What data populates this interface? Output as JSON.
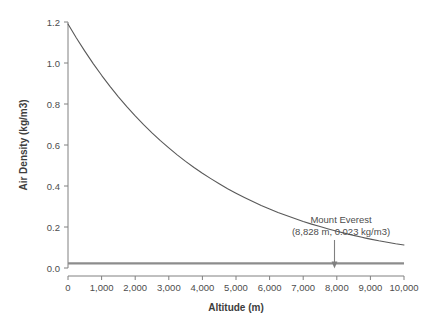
{
  "chart_data": {
    "type": "line",
    "title": "",
    "xlabel": "Altitude (m)",
    "ylabel": "Air Density (kg/m3)",
    "xlim": [
      0,
      10000
    ],
    "ylim": [
      0.0,
      1.2
    ],
    "grid": false,
    "legend": "none",
    "xtick_labels": [
      "0",
      "1,000",
      "2,000",
      "3,000",
      "4,000",
      "5,000",
      "6,000",
      "7,000",
      "8,000",
      "9,000",
      "10,000"
    ],
    "xtick_values": [
      0,
      1000,
      2000,
      3000,
      4000,
      5000,
      6000,
      7000,
      8000,
      9000,
      10000
    ],
    "ytick_labels": [
      "0.0",
      "0.2",
      "0.4",
      "0.6",
      "0.8",
      "1.0",
      "1.2"
    ],
    "ytick_values": [
      0.0,
      0.2,
      0.4,
      0.6,
      0.8,
      1.0,
      1.2
    ],
    "series": [
      {
        "name": "Air density vs altitude",
        "x": [
          0,
          250,
          500,
          750,
          1000,
          1250,
          1500,
          1750,
          2000,
          2250,
          2500,
          2750,
          3000,
          3250,
          3500,
          3750,
          4000,
          4250,
          4500,
          4750,
          5000,
          5250,
          5500,
          5750,
          6000,
          6250,
          6500,
          6750,
          7000,
          7250,
          7500,
          7750,
          8000,
          8250,
          8500,
          8750,
          8828,
          9000,
          9250,
          9500,
          9750,
          10000
        ],
        "values": [
          1.19,
          1.122,
          1.058,
          0.997,
          0.94,
          0.886,
          0.835,
          0.787,
          0.742,
          0.699,
          0.659,
          0.621,
          0.586,
          0.552,
          0.52,
          0.49,
          0.462,
          0.436,
          0.411,
          0.387,
          0.365,
          0.344,
          0.324,
          0.305,
          0.288,
          0.271,
          0.256,
          0.241,
          0.227,
          0.214,
          0.202,
          0.19,
          0.179,
          0.169,
          0.159,
          0.15,
          0.147,
          0.141,
          0.133,
          0.126,
          0.118,
          0.112
        ]
      }
    ],
    "reference_line": {
      "name": "Mount Everest density level",
      "y": 0.023,
      "label": "0.023 kg/m3"
    },
    "annotations": [
      {
        "name": "mount-everest-annotation",
        "line1": "Mount Everest",
        "line2": "(8,828 m, 0.023 kg/m3)",
        "x": 8828,
        "y": 0.023,
        "arrow": "down-arrow"
      }
    ],
    "colors": {
      "curve": "#595959",
      "axis": "#808080",
      "reference_line": "#8c8c8c",
      "text": "#4d4d4d",
      "background": "#ffffff"
    }
  }
}
